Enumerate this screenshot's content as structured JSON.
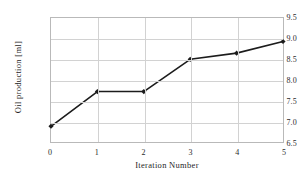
{
  "chart_data": {
    "type": "line",
    "title": "",
    "xlabel": "Iteration Number",
    "ylabel": "Oil production [ml]",
    "x": [
      0,
      1,
      2,
      3,
      4,
      5
    ],
    "values": [
      6.88,
      7.72,
      7.72,
      8.5,
      8.65,
      8.93
    ],
    "series": [
      {
        "name": "Oil production",
        "values": [
          6.88,
          7.72,
          7.72,
          8.5,
          8.65,
          8.93
        ]
      }
    ],
    "xlim": [
      0,
      5
    ],
    "ylim": [
      6.5,
      9.5
    ],
    "xticks": [
      0,
      1,
      2,
      3,
      4,
      5
    ],
    "yticks": [
      6.5,
      7.0,
      7.5,
      8.0,
      8.5,
      9.0,
      9.5
    ],
    "xtick_labels": [
      "0",
      "1",
      "2",
      "3",
      "4",
      "5"
    ],
    "ytick_labels": [
      "6.5",
      "7.0",
      "7.5",
      "8.0",
      "8.5",
      "9.0",
      "9.5"
    ],
    "grid": true,
    "grid_axes": "both",
    "legend": false,
    "legend_position": "none",
    "marker": "diamond",
    "line_color": "#1c1c1c",
    "marker_color": "#1c1c1c",
    "grid_color": "#d2d2d2",
    "frame_color": "#b9b9b9",
    "background_color": "#ffffff"
  }
}
